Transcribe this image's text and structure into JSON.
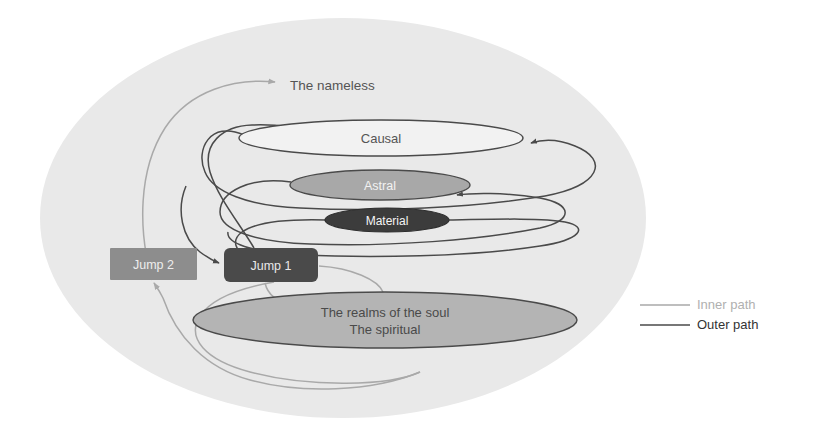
{
  "canvas": {
    "width": 816,
    "height": 441,
    "background": "#ffffff"
  },
  "colors": {
    "backdrop": "#e9e9e9",
    "inner_path": "#a9a9a9",
    "outer_path": "#4a4a4a",
    "causal_fill": "#f2f2f2",
    "causal_text": "#555555",
    "astral_fill": "#a8a8a8",
    "astral_text": "#f2f2f2",
    "material_fill": "#3c3c3c",
    "material_text": "#f5f5f5",
    "soul_fill": "#b4b4b4",
    "soul_text": "#4a4a4a",
    "jump1_fill": "#4a4a4a",
    "jump1_text": "#e8e8e8",
    "jump2_fill": "#8d8d8d",
    "jump2_text": "#ededed",
    "stroke_dark": "#4a4a4a",
    "nameless_text": "#555555",
    "legend_inner_text": "#b0b0b0",
    "legend_outer_text": "#333333"
  },
  "backdrop": {
    "label": "background-oval",
    "cx": 343,
    "cy": 218,
    "rx": 303,
    "ry": 200
  },
  "nodes": {
    "nameless": {
      "label": "The nameless",
      "x": 290,
      "y": 86
    },
    "causal": {
      "label": "Causal",
      "cx": 381,
      "cy": 138,
      "rx": 142,
      "ry": 18
    },
    "astral": {
      "label": "Astral",
      "cx": 380,
      "cy": 185,
      "rx": 90,
      "ry": 15
    },
    "material": {
      "label": "Material",
      "cx": 387,
      "cy": 220,
      "rx": 62,
      "ry": 12
    },
    "soul": {
      "line1": "The realms of the soul",
      "line2": "The spiritual",
      "cx": 385,
      "cy": 320,
      "rx": 192,
      "ry": 28
    },
    "jump1": {
      "label": "Jump 1",
      "x": 224,
      "y": 248,
      "w": 94,
      "h": 34
    },
    "jump2": {
      "label": "Jump 2",
      "x": 110,
      "y": 248,
      "w": 87,
      "h": 32
    }
  },
  "legend": {
    "items": [
      {
        "label": "Inner path",
        "color": "#a9a9a9",
        "y": 305
      },
      {
        "label": "Outer path",
        "color": "#4a4a4a",
        "y": 325
      }
    ],
    "line_x1": 640,
    "line_x2": 690,
    "text_x": 697
  },
  "diagram_meta": {
    "type": "spiral-flow-diagram",
    "description": "Nested concentric path diagram of planes of existence"
  }
}
